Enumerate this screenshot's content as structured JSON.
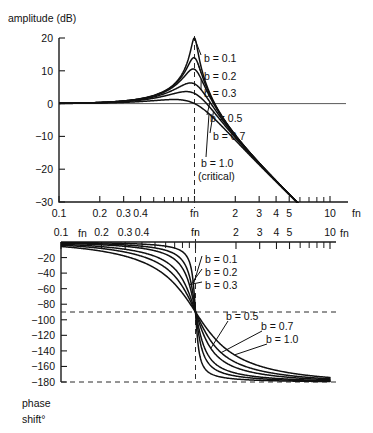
{
  "figure": {
    "caption": "",
    "amplitude_axis_title": "amplitude (dB)",
    "phase_axis_title_line1": "phase",
    "phase_axis_title_line2": "shift°",
    "frequency_unit": "fn"
  },
  "chart_data": [
    {
      "type": "line",
      "id": "amplitude",
      "title": "amplitude (dB)",
      "xlabel": "fn",
      "ylabel": "amplitude (dB)",
      "xscale": "log",
      "xlim": [
        0.1,
        10
      ],
      "ylim": [
        -30,
        20
      ],
      "grid": false,
      "legend_position": "inline-annotations",
      "xticks": [
        0.1,
        0.2,
        0.3,
        0.4,
        1,
        2,
        3,
        4,
        5,
        10
      ],
      "xticklabels": [
        "0.1",
        "0.2",
        "0.3",
        "0.4",
        "fn",
        "2",
        "3",
        "4",
        "5",
        "10"
      ],
      "xticks_minor": [
        0.5,
        0.6,
        0.7,
        0.8,
        0.9,
        6,
        7,
        8,
        9
      ],
      "yticks": [
        20,
        10,
        0,
        -10,
        -20,
        -30
      ],
      "yticklabels": [
        "20",
        "10",
        "0",
        "−10",
        "−20",
        "−30"
      ],
      "reference_lines": [
        {
          "kind": "horizontal",
          "value": 0,
          "style": "solid"
        },
        {
          "kind": "vertical",
          "value": 1,
          "style": "dashed",
          "label": "fn"
        }
      ],
      "series": [
        {
          "name": "b = 0.1",
          "b": 0.1,
          "peak_db": 14.0,
          "peak_at": 1.0
        },
        {
          "name": "b = 0.2",
          "b": 0.2,
          "peak_db": 8.0,
          "peak_at": 1.0
        },
        {
          "name": "b = 0.3",
          "b": 0.3,
          "peak_db": 4.8,
          "peak_at": 1.0
        },
        {
          "name": "b = 0.5",
          "b": 0.5,
          "peak_db": 1.2,
          "peak_at": 1.0
        },
        {
          "name": "b = 0.7",
          "b": 0.7,
          "peak_db": 0.0,
          "peak_at": 1.0
        },
        {
          "name": "b = 1.0",
          "b": 1.0,
          "peak_db": -6.0,
          "peak_at": 1.0
        }
      ],
      "annotations": [
        {
          "text": "b = 0.1",
          "b": 0.1
        },
        {
          "text": "b = 0.2",
          "b": 0.2
        },
        {
          "text": "b = 0.3",
          "b": 0.3
        },
        {
          "text": "b = 0.5",
          "b": 0.5
        },
        {
          "text": "b = 0.7",
          "b": 0.7
        },
        {
          "text": "b = 1.0",
          "b": 1.0
        },
        {
          "text": "(critical)",
          "b": 1.0
        }
      ]
    },
    {
      "type": "line",
      "id": "phase",
      "title": "phase shift°",
      "xlabel": "fn",
      "ylabel": "phase shift°",
      "xscale": "log",
      "xlim": [
        0.1,
        10
      ],
      "ylim": [
        -180,
        0
      ],
      "grid": false,
      "xaxis_position": "top",
      "legend_position": "inline-annotations",
      "xticks": [
        0.1,
        0.2,
        0.3,
        0.4,
        1,
        2,
        3,
        4,
        5,
        10
      ],
      "xticklabels": [
        "0.1",
        "0.2",
        "0.3",
        "0.4",
        "fn",
        "2",
        "3",
        "4",
        "5",
        "10"
      ],
      "xticks_minor": [
        0.5,
        0.6,
        0.7,
        0.8,
        0.9,
        6,
        7,
        8,
        9
      ],
      "yticks": [
        -20,
        -40,
        -60,
        -80,
        -100,
        -120,
        -140,
        -160,
        -180
      ],
      "yticklabels": [
        "−20",
        "−40",
        "−60",
        "−80",
        "−100",
        "−120",
        "−140",
        "−160",
        "−180"
      ],
      "reference_lines": [
        {
          "kind": "horizontal",
          "value": -90,
          "style": "dashed"
        },
        {
          "kind": "horizontal",
          "value": -180,
          "style": "dashed"
        },
        {
          "kind": "vertical",
          "value": 1,
          "style": "dashed",
          "label": "fn"
        }
      ],
      "series": [
        {
          "name": "b = 0.1",
          "b": 0.1,
          "phase_at_fn": -90
        },
        {
          "name": "b = 0.2",
          "b": 0.2,
          "phase_at_fn": -90
        },
        {
          "name": "b = 0.3",
          "b": 0.3,
          "phase_at_fn": -90
        },
        {
          "name": "b = 0.5",
          "b": 0.5,
          "phase_at_fn": -90
        },
        {
          "name": "b = 0.7",
          "b": 0.7,
          "phase_at_fn": -90
        },
        {
          "name": "b = 1.0",
          "b": 1.0,
          "phase_at_fn": -90
        }
      ],
      "annotations": [
        {
          "text": "b = 0.1",
          "b": 0.1
        },
        {
          "text": "b = 0.2",
          "b": 0.2
        },
        {
          "text": "b = 0.3",
          "b": 0.3
        },
        {
          "text": "b = 0.5",
          "b": 0.5
        },
        {
          "text": "b = 0.7",
          "b": 0.7
        },
        {
          "text": "b = 1.0",
          "b": 1.0
        }
      ]
    }
  ],
  "labels": {
    "b01": "b = 0.1",
    "b02": "b = 0.2",
    "b03": "b = 0.3",
    "b05": "b = 0.5",
    "b07": "b = 0.7",
    "b10": "b = 1.0",
    "critical": "(critical)"
  },
  "colors": {
    "curve": "#111111",
    "axis": "#1a1a1a",
    "zero_line": "#5a5a5a",
    "background": "#ffffff"
  }
}
